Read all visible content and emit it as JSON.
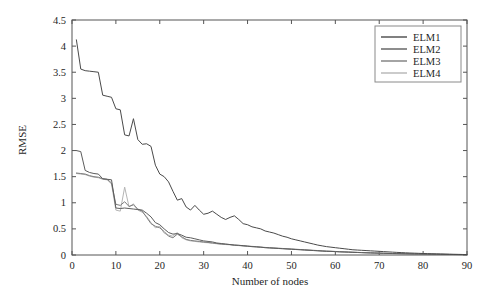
{
  "chart_data": {
    "type": "line",
    "title": "",
    "xlabel": "Number of nodes",
    "ylabel": "RMSE",
    "xlim": [
      0,
      90
    ],
    "ylim": [
      0,
      4.5
    ],
    "xticks": [
      0,
      10,
      20,
      30,
      40,
      50,
      60,
      70,
      80,
      90
    ],
    "yticks": [
      0,
      0.5,
      1,
      1.5,
      2,
      2.5,
      3,
      3.5,
      4,
      4.5
    ],
    "xtick_labels": [
      "0",
      "10",
      "20",
      "30",
      "40",
      "50",
      "60",
      "70",
      "80",
      "90"
    ],
    "ytick_labels": [
      "0",
      "0.5",
      "1",
      "1.5",
      "2",
      "2.5",
      "3",
      "3.5",
      "4",
      "4.5"
    ],
    "grid": false,
    "legend_position": "upper right",
    "x": [
      1,
      2,
      3,
      4,
      5,
      6,
      7,
      8,
      9,
      10,
      11,
      12,
      13,
      14,
      15,
      16,
      17,
      18,
      19,
      20,
      21,
      22,
      23,
      24,
      25,
      26,
      27,
      28,
      29,
      30,
      31,
      32,
      33,
      34,
      35,
      36,
      37,
      38,
      39,
      40,
      41,
      42,
      43,
      44,
      45,
      46,
      47,
      48,
      49,
      50,
      51,
      52,
      53,
      54,
      55,
      56,
      57,
      58,
      59,
      60,
      61,
      62,
      63,
      64,
      65,
      66,
      67,
      68,
      69,
      70,
      71,
      72,
      73,
      74,
      75,
      76,
      77,
      78,
      79,
      80,
      81,
      82,
      83,
      84,
      85,
      86,
      87,
      88,
      89,
      90
    ],
    "series": [
      {
        "name": "ELM1",
        "color": "#4a4a4a",
        "values": [
          4.12,
          3.56,
          3.53,
          3.52,
          3.51,
          3.5,
          3.06,
          3.04,
          3.02,
          2.8,
          2.78,
          2.3,
          2.28,
          2.61,
          2.21,
          2.12,
          2.13,
          2.08,
          1.72,
          1.55,
          1.5,
          1.4,
          1.22,
          1.05,
          1.08,
          0.92,
          0.86,
          0.95,
          0.86,
          0.78,
          0.8,
          0.84,
          0.78,
          0.72,
          0.68,
          0.72,
          0.75,
          0.68,
          0.6,
          0.58,
          0.54,
          0.52,
          0.5,
          0.46,
          0.44,
          0.42,
          0.39,
          0.36,
          0.34,
          0.31,
          0.29,
          0.27,
          0.25,
          0.23,
          0.21,
          0.19,
          0.175,
          0.16,
          0.15,
          0.14,
          0.13,
          0.12,
          0.11,
          0.1,
          0.095,
          0.09,
          0.085,
          0.08,
          0.075,
          0.07,
          0.065,
          0.06,
          0.055,
          0.05,
          0.046,
          0.042,
          0.038,
          0.035,
          0.032,
          0.029,
          0.026,
          0.024,
          0.022,
          0.02,
          0.018,
          0.016,
          0.014,
          0.012,
          0.01,
          0.008
        ]
      },
      {
        "name": "ELM2",
        "color": "#5c5c5c",
        "values": [
          2.0,
          1.98,
          1.62,
          1.58,
          1.56,
          1.55,
          1.46,
          1.45,
          1.44,
          0.9,
          0.89,
          0.9,
          0.89,
          0.88,
          0.87,
          0.86,
          0.8,
          0.73,
          0.62,
          0.58,
          0.5,
          0.43,
          0.4,
          0.41,
          0.38,
          0.34,
          0.33,
          0.31,
          0.29,
          0.27,
          0.26,
          0.25,
          0.23,
          0.22,
          0.21,
          0.2,
          0.19,
          0.185,
          0.18,
          0.17,
          0.16,
          0.155,
          0.15,
          0.14,
          0.135,
          0.13,
          0.125,
          0.12,
          0.115,
          0.11,
          0.105,
          0.1,
          0.095,
          0.09,
          0.085,
          0.08,
          0.075,
          0.07,
          0.068,
          0.065,
          0.06,
          0.058,
          0.055,
          0.05,
          0.048,
          0.045,
          0.042,
          0.04,
          0.038,
          0.035,
          0.033,
          0.03,
          0.028,
          0.026,
          0.024,
          0.022,
          0.02,
          0.018,
          0.017,
          0.016,
          0.015,
          0.014,
          0.013,
          0.012,
          0.011,
          0.01,
          0.009,
          0.008,
          0.007,
          0.006
        ]
      },
      {
        "name": "ELM3",
        "color": "#7d7d7d",
        "values": [
          1.57,
          1.56,
          1.55,
          1.52,
          1.5,
          1.49,
          1.46,
          1.45,
          1.38,
          0.97,
          0.95,
          1.02,
          0.93,
          0.96,
          0.88,
          0.84,
          0.72,
          0.6,
          0.55,
          0.52,
          0.45,
          0.36,
          0.33,
          0.4,
          0.35,
          0.3,
          0.28,
          0.27,
          0.26,
          0.25,
          0.24,
          0.23,
          0.22,
          0.21,
          0.205,
          0.2,
          0.19,
          0.185,
          0.175,
          0.17,
          0.165,
          0.16,
          0.15,
          0.145,
          0.14,
          0.135,
          0.13,
          0.125,
          0.12,
          0.115,
          0.11,
          0.105,
          0.1,
          0.095,
          0.09,
          0.085,
          0.08,
          0.075,
          0.072,
          0.068,
          0.064,
          0.06,
          0.057,
          0.054,
          0.05,
          0.047,
          0.044,
          0.041,
          0.038,
          0.036,
          0.033,
          0.031,
          0.029,
          0.027,
          0.025,
          0.023,
          0.021,
          0.019,
          0.018,
          0.016,
          0.015,
          0.014,
          0.013,
          0.012,
          0.011,
          0.01,
          0.009,
          0.008,
          0.007,
          0.006
        ]
      },
      {
        "name": "ELM4",
        "color": "#b5b5b5",
        "values": [
          1.56,
          1.55,
          1.54,
          1.51,
          1.49,
          1.48,
          1.45,
          1.44,
          1.36,
          0.86,
          0.84,
          1.3,
          0.92,
          0.98,
          0.86,
          0.82,
          0.74,
          0.62,
          0.52,
          0.55,
          0.42,
          0.38,
          0.36,
          0.43,
          0.33,
          0.29,
          0.27,
          0.26,
          0.25,
          0.24,
          0.235,
          0.225,
          0.215,
          0.205,
          0.2,
          0.195,
          0.185,
          0.18,
          0.17,
          0.165,
          0.16,
          0.155,
          0.148,
          0.142,
          0.137,
          0.132,
          0.127,
          0.122,
          0.117,
          0.112,
          0.107,
          0.102,
          0.097,
          0.092,
          0.087,
          0.082,
          0.078,
          0.073,
          0.07,
          0.066,
          0.062,
          0.058,
          0.055,
          0.052,
          0.049,
          0.046,
          0.043,
          0.04,
          0.037,
          0.035,
          0.032,
          0.03,
          0.028,
          0.026,
          0.024,
          0.022,
          0.02,
          0.019,
          0.017,
          0.016,
          0.015,
          0.013,
          0.012,
          0.011,
          0.01,
          0.009,
          0.008,
          0.007,
          0.006,
          0.005
        ]
      }
    ]
  },
  "legend": {
    "entries": [
      {
        "label": "ELM1",
        "color": "#4a4a4a"
      },
      {
        "label": "ELM2",
        "color": "#5c5c5c"
      },
      {
        "label": "ELM3",
        "color": "#7d7d7d"
      },
      {
        "label": "ELM4",
        "color": "#b5b5b5"
      }
    ]
  },
  "axes": {
    "x_title": "Number of nodes",
    "y_title": "RMSE"
  }
}
